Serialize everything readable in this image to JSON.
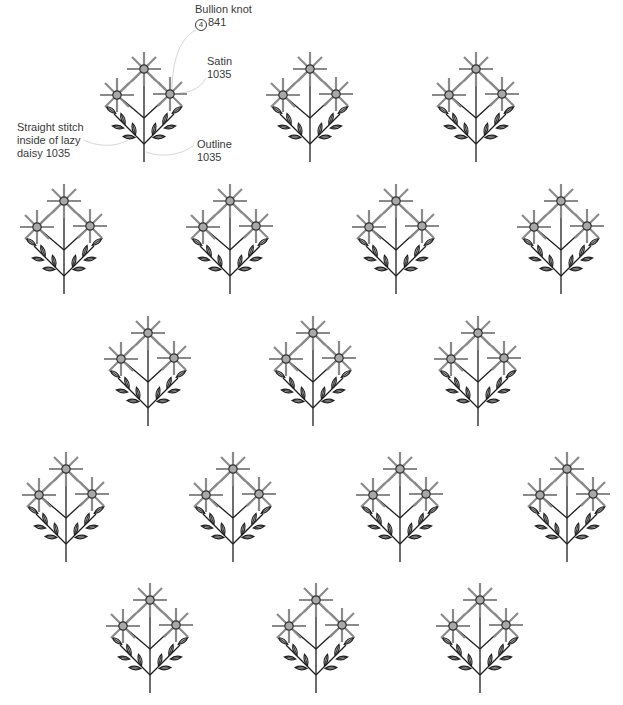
{
  "diagram": {
    "type": "embroidery-pattern",
    "motif": "three-flower sprig with leafy branches",
    "colors": {
      "ray": "#8a8a8a",
      "center_fill": "#a8a8a8",
      "center_stroke": "#333333",
      "stem": "#1e1e1e",
      "leaf_fill": "#b4b4b4",
      "leaf_stroke": "#1e1e1e",
      "leader": "#d6d6d6",
      "text": "#3a3a3a"
    },
    "annotations": [
      {
        "id": "bullion",
        "line1": "Bullion knot",
        "strands": "4",
        "line2_rest": "841"
      },
      {
        "id": "satin",
        "line1": "Satin",
        "line2": "1035"
      },
      {
        "id": "straight",
        "line1": "Straight stitch",
        "line2": "inside of lazy",
        "line3": "daisy 1035"
      },
      {
        "id": "outline",
        "line1": "Outline",
        "line2": "1035"
      }
    ],
    "rows": [
      {
        "top_y": 69,
        "stems_x": [
          144,
          310,
          476
        ]
      },
      {
        "top_y": 201,
        "stems_x": [
          64,
          230,
          396,
          561
        ]
      },
      {
        "top_y": 333,
        "stems_x": [
          148,
          313,
          478
        ]
      },
      {
        "top_y": 469,
        "stems_x": [
          66,
          233,
          400,
          567
        ]
      },
      {
        "top_y": 600,
        "stems_x": [
          150,
          316,
          480
        ]
      }
    ],
    "motif_count": 17
  }
}
